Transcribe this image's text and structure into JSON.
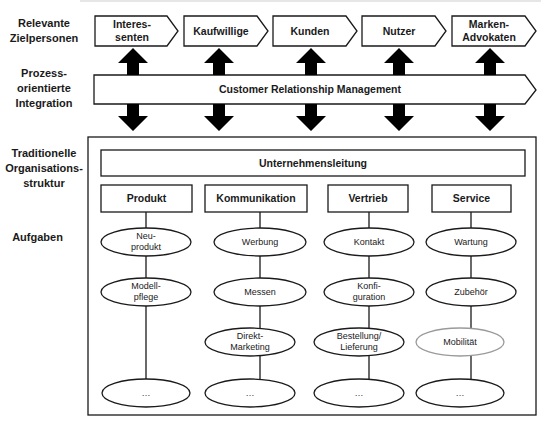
{
  "row_labels": {
    "target_persons": "Relevante Zielpersonen",
    "process_integration": "Prozess-orientierte Integration",
    "traditional_structure": "Traditionelle Organisations-struktur",
    "tasks": "Aufgaben"
  },
  "target_persons": [
    {
      "label_line1": "Interes-",
      "label_line2": "senten"
    },
    {
      "label_line1": "Kaufwillige",
      "label_line2": ""
    },
    {
      "label_line1": "Kunden",
      "label_line2": ""
    },
    {
      "label_line1": "Nutzer",
      "label_line2": ""
    },
    {
      "label_line1": "Marken-",
      "label_line2": "Advokaten"
    }
  ],
  "crm_bar": {
    "label": "Customer Relationship Management"
  },
  "management": {
    "label": "Unternehmensleitung"
  },
  "departments": [
    {
      "label": "Produkt",
      "tasks": [
        {
          "line1": "Neu-",
          "line2": "produkt",
          "highlight": false
        },
        {
          "line1": "Modell-",
          "line2": "pflege",
          "highlight": false
        },
        {
          "line1": "…",
          "line2": "",
          "highlight": false
        }
      ]
    },
    {
      "label": "Kommunikation",
      "tasks": [
        {
          "line1": "Werbung",
          "line2": "",
          "highlight": false
        },
        {
          "line1": "Messen",
          "line2": "",
          "highlight": false
        },
        {
          "line1": "Direkt-",
          "line2": "Marketing",
          "highlight": false
        },
        {
          "line1": "…",
          "line2": "",
          "highlight": false
        }
      ]
    },
    {
      "label": "Vertrieb",
      "tasks": [
        {
          "line1": "Kontakt",
          "line2": "",
          "highlight": false
        },
        {
          "line1": "Konfi-",
          "line2": "guration",
          "highlight": false
        },
        {
          "line1": "Bestellung/",
          "line2": "Lieferung",
          "highlight": false
        },
        {
          "line1": "…",
          "line2": "",
          "highlight": false
        }
      ]
    },
    {
      "label": "Service",
      "tasks": [
        {
          "line1": "Wartung",
          "line2": "",
          "highlight": false
        },
        {
          "line1": "Zubehör",
          "line2": "",
          "highlight": false
        },
        {
          "line1": "Mobilität",
          "line2": "",
          "highlight": true
        },
        {
          "line1": "…",
          "line2": "",
          "highlight": false
        }
      ]
    }
  ],
  "colors": {
    "stroke": "#1a1a1a",
    "highlight_stroke": "#9a9a9a",
    "arrow_fill": "#000000",
    "background": "#ffffff"
  }
}
